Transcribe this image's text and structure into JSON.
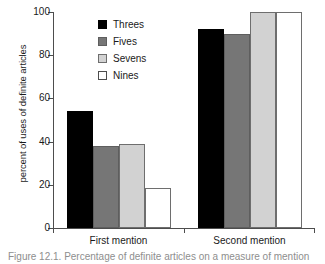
{
  "chart_data": {
    "type": "bar",
    "title": "",
    "xlabel": "",
    "ylabel": "percent of uses of definite articles",
    "ylim": [
      0,
      100
    ],
    "yticks": [
      0,
      20,
      40,
      60,
      80,
      100
    ],
    "ytick_labels": [
      "0",
      "20",
      "40",
      "60",
      "80",
      "100"
    ],
    "grid": false,
    "legend_position": "upper-left-inside",
    "categories": [
      "First mention",
      "Second mention"
    ],
    "series": [
      {
        "name": "Threes",
        "color": "#000000",
        "values": [
          54,
          92
        ]
      },
      {
        "name": "Fives",
        "color": "#767676",
        "values": [
          38,
          90
        ]
      },
      {
        "name": "Sevens",
        "color": "#d2d2d2",
        "values": [
          39,
          100
        ]
      },
      {
        "name": "Nines",
        "color": "#ffffff",
        "values": [
          18.5,
          100
        ]
      }
    ]
  },
  "caption": {
    "text": "Figure 12.1. Percentage of definite articles on a measure of mention"
  }
}
